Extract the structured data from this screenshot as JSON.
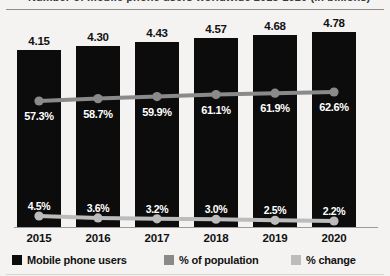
{
  "title": {
    "cut_off_line": "Number of mobile phone users worldwide 2015-2020 (in billions)"
  },
  "legend": {
    "position": "bottom",
    "items": [
      {
        "label": "Mobile phone users",
        "color": "#0c0c0c",
        "name": "legend-mobile-phone-users"
      },
      {
        "label": "% of population",
        "color": "#8a8a8a",
        "name": "legend-percent-of-population"
      },
      {
        "label": "% change",
        "color": "#bcbcbc",
        "name": "legend-percent-change"
      }
    ]
  },
  "chart_data": {
    "type": "bar",
    "title": "Number of mobile phone users worldwide 2015-2020 (in billions)",
    "xlabel": "",
    "ylabel": "",
    "grid": false,
    "categories": [
      "2015",
      "2016",
      "2017",
      "2018",
      "2019",
      "2020"
    ],
    "series": [
      {
        "name": "Mobile phone users",
        "type": "bar",
        "unit": "billions",
        "color": "#0c0c0c",
        "values": [
          4.15,
          4.3,
          4.43,
          4.57,
          4.68,
          4.78
        ],
        "labels": [
          "4.15",
          "4.30",
          "4.43",
          "4.57",
          "4.68",
          "4.78"
        ]
      },
      {
        "name": "% of population",
        "type": "line",
        "unit": "percent",
        "color": "#8a8a8a",
        "values": [
          57.3,
          58.7,
          59.9,
          61.1,
          61.9,
          62.6
        ],
        "labels": [
          "57.3%",
          "58.7%",
          "59.9%",
          "61.1%",
          "61.9%",
          "62.6%"
        ]
      },
      {
        "name": "% change",
        "type": "line",
        "unit": "percent",
        "color": "#bcbcbc",
        "values": [
          4.5,
          3.6,
          3.2,
          3.0,
          2.5,
          2.2
        ],
        "labels": [
          "4.5%",
          "3.6%",
          "3.2%",
          "3.0%",
          "2.5%",
          "2.2%"
        ]
      }
    ]
  },
  "colors": {
    "bar": "#0c0c0c",
    "population_line": "#8a8a8a",
    "change_line": "#bcbcbc",
    "background": "#f4f3f1",
    "axis": "#9a9a9a",
    "text": "#111111",
    "inverse_text": "#ffffff"
  }
}
